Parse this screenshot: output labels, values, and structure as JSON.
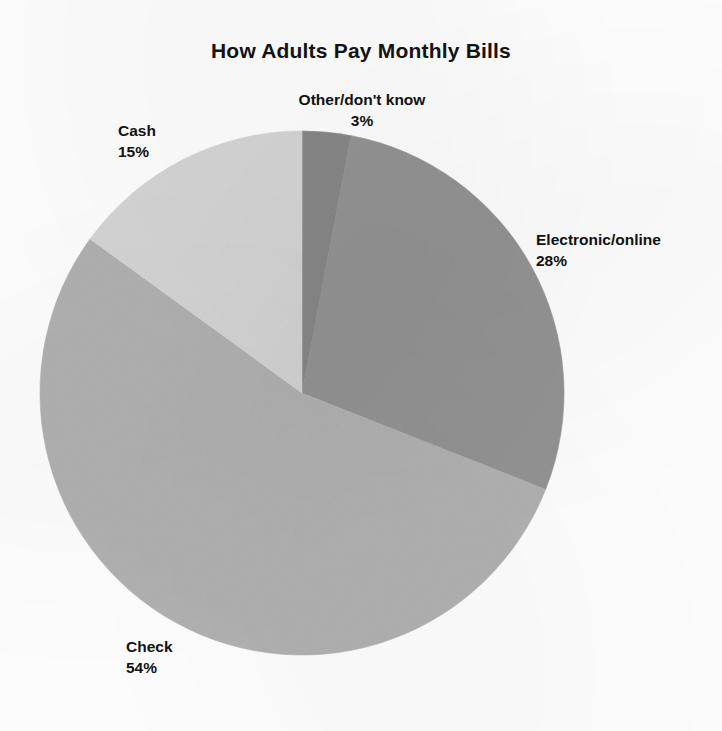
{
  "figure": {
    "title": "How Adults Pay Monthly Bills",
    "background_color": "#ffffff",
    "text_color": "#131313"
  },
  "labels": {
    "other": {
      "name": "Other/don't know",
      "pct": "3%"
    },
    "cash": {
      "name": "Cash",
      "pct": "15%"
    },
    "electronic": {
      "name": "Electronic/online",
      "pct": "28%"
    },
    "check": {
      "name": "Check",
      "pct": "54%"
    }
  },
  "chart_data": {
    "type": "pie",
    "title": "How Adults Pay Monthly Bills",
    "xlabel": "",
    "ylabel": "",
    "units": "percent",
    "total": 100,
    "start_angle_deg": 0,
    "direction": "clockwise",
    "legend": "none",
    "labels_position": "outside-callout",
    "grid": false,
    "categories": [
      "Other/don't know",
      "Electronic/online",
      "Check",
      "Cash"
    ],
    "values": [
      3,
      28,
      54,
      15
    ],
    "slices": [
      {
        "label": "Other/don't know",
        "value": 3,
        "display": "3%",
        "color": "#8a8a8a",
        "start_deg": 0,
        "end_deg": 10.8
      },
      {
        "label": "Electronic/online",
        "value": 28,
        "display": "28%",
        "color": "#969696",
        "start_deg": 10.8,
        "end_deg": 111.6
      },
      {
        "label": "Check",
        "value": 54,
        "display": "54%",
        "color": "#b4b4b4",
        "start_deg": 111.6,
        "end_deg": 306.0
      },
      {
        "label": "Cash",
        "value": 15,
        "display": "15%",
        "color": "#d8d8d8",
        "start_deg": 306.0,
        "end_deg": 360.0
      }
    ],
    "geometry": {
      "center_x": 302,
      "center_y": 393,
      "radius": 262
    }
  }
}
